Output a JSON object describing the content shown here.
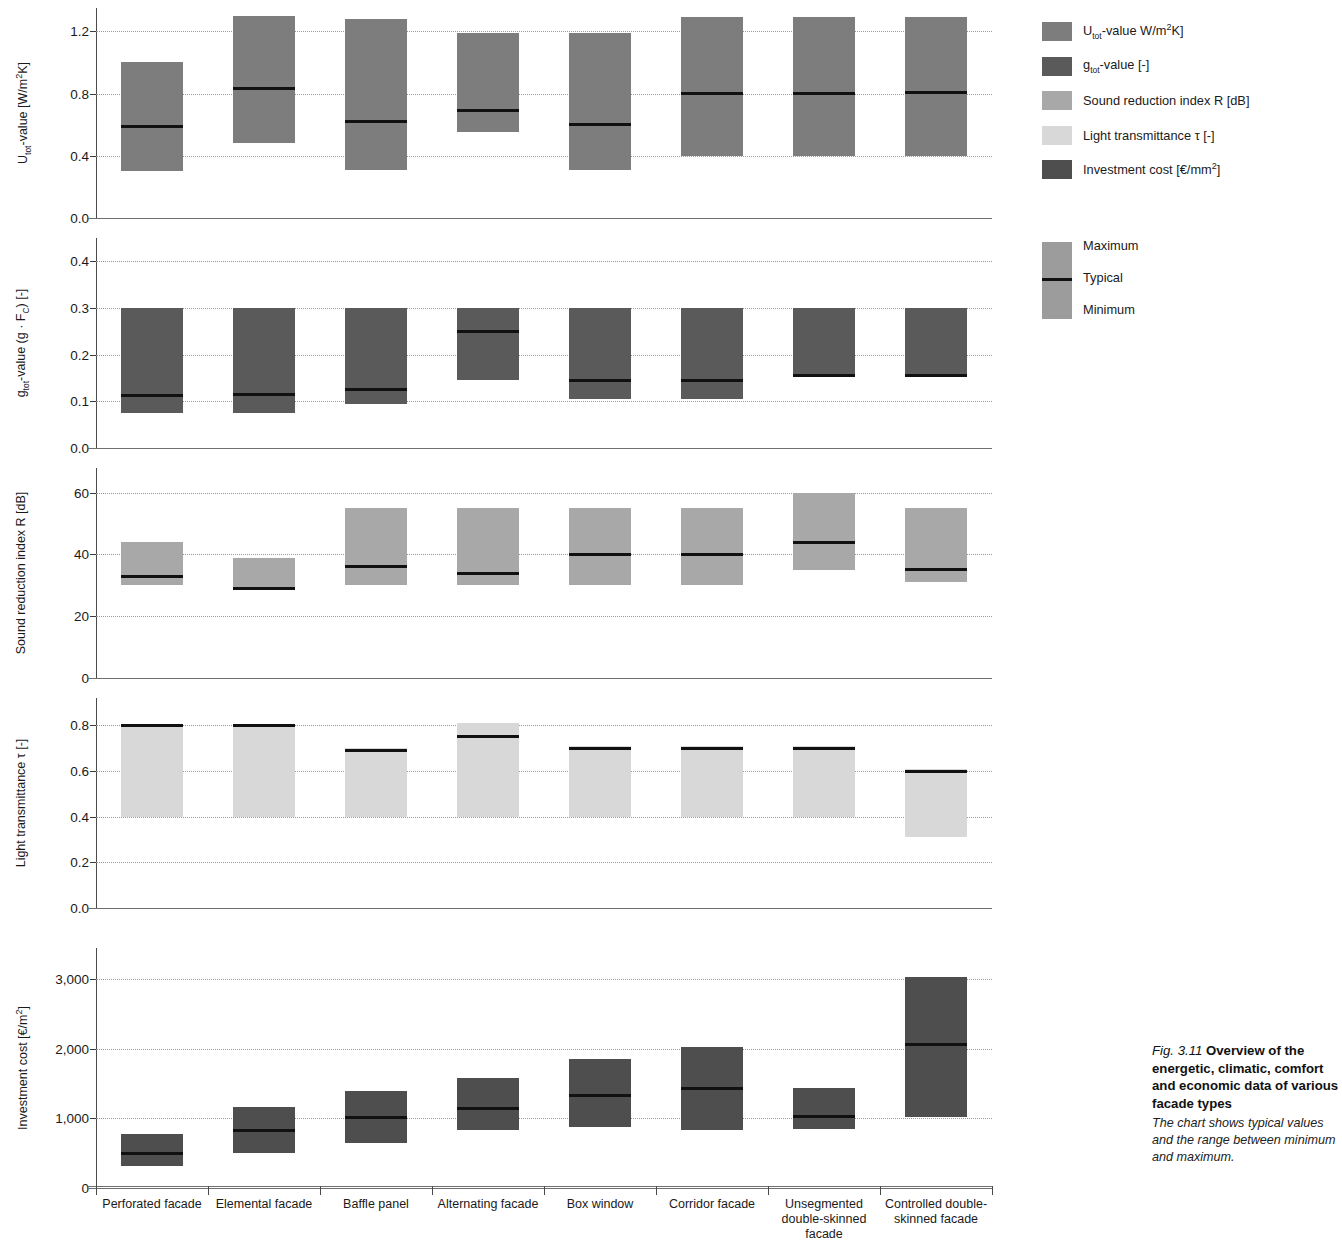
{
  "legend": {
    "items": [
      {
        "name": "u-tot-value",
        "label_html": "U<sub>tot</sub>-value W/m<sup>2</sup>K]",
        "label": "U tot-value W/m2K]",
        "color": "#7d7d7d"
      },
      {
        "name": "g-tot-value",
        "label_html": "g<sub>tot</sub>-value [-]",
        "label": "g tot-value [-]",
        "color": "#5a5a5a"
      },
      {
        "name": "sound-reduction-index",
        "label_html": "Sound reduction index R [dB]",
        "label": "Sound reduction index R [dB]",
        "color": "#a8a8a8"
      },
      {
        "name": "light-transmittance",
        "label_html": "Light transmittance τ [-]",
        "label": "Light transmittance τ [-]",
        "color": "#d8d8d8"
      },
      {
        "name": "investment-cost",
        "label_html": "Investment cost  [€/mm<sup>2</sup>]",
        "label": "Investment cost [€/mm2]",
        "color": "#4e4e4e"
      }
    ],
    "range_legend": {
      "maximum": "Maximum",
      "typical": "Typical",
      "minimum": "Minimum",
      "color": "#9c9c9c"
    }
  },
  "caption": {
    "fig_number": "Fig. 3.11",
    "title": "Overview of the energetic, climatic, comfort and economic data of various facade types",
    "body": "The chart shows typical values and the range between minimum and maximum."
  },
  "chart_data": {
    "type": "bar",
    "title": "Overview of the energetic, climatic, comfort and economic data of various facade types",
    "xlabel": "",
    "grid": true,
    "legend_position": "right",
    "categories": [
      "Perforated facade",
      "Elemental facade",
      "Baffle panel",
      "Alternating facade",
      "Box window",
      "Corridor facade",
      "Unsegmented double-skinned facade",
      "Controlled double-skinned facade"
    ],
    "panels": [
      {
        "key": "u_tot",
        "ylabel_html": "U<sub>tot</sub>-value [W/m<sup>2</sup>K]",
        "ylabel": "U tot-value [W/m2K]",
        "color": "#7d7d7d",
        "ylim": [
          0.0,
          1.35
        ],
        "yticks": [
          0.0,
          0.4,
          0.8,
          1.2
        ],
        "yticklabels": [
          "0.0",
          "0.4",
          "0.8",
          "1.2"
        ],
        "minimum": [
          0.3,
          0.48,
          0.31,
          0.55,
          0.31,
          0.4,
          0.4,
          0.4
        ],
        "typical": [
          0.59,
          0.83,
          0.62,
          0.69,
          0.6,
          0.8,
          0.8,
          0.81
        ],
        "maximum": [
          1.0,
          1.3,
          1.28,
          1.19,
          1.19,
          1.29,
          1.29,
          1.29
        ]
      },
      {
        "key": "g_tot",
        "ylabel_html": "g<sub>tot</sub>-value (g &middot; F<sub>C</sub>) [-]",
        "ylabel": "g tot-value (g . F C) [-]",
        "color": "#5a5a5a",
        "ylim": [
          0.0,
          0.45
        ],
        "yticks": [
          0.0,
          0.1,
          0.2,
          0.3,
          0.4
        ],
        "yticklabels": [
          "0.0",
          "0.1",
          "0.2",
          "0.3",
          "0.4"
        ],
        "minimum": [
          0.075,
          0.075,
          0.095,
          0.145,
          0.105,
          0.105,
          0.155,
          0.155
        ],
        "typical": [
          0.113,
          0.115,
          0.125,
          0.25,
          0.145,
          0.145,
          0.155,
          0.155
        ],
        "maximum": [
          0.3,
          0.3,
          0.3,
          0.3,
          0.3,
          0.3,
          0.3,
          0.3
        ]
      },
      {
        "key": "sound_reduction",
        "ylabel_html": "Sound reduction index R [dB]",
        "ylabel": "Sound reduction index R [dB]",
        "color": "#a8a8a8",
        "ylim": [
          0,
          68
        ],
        "yticks": [
          0,
          20,
          40,
          60
        ],
        "yticklabels": [
          "0",
          "20",
          "40",
          "60"
        ],
        "minimum": [
          30,
          29,
          30,
          30,
          30,
          30,
          35,
          31
        ],
        "typical": [
          33,
          29,
          36,
          34,
          40,
          40,
          44,
          35
        ],
        "maximum": [
          44,
          39,
          55,
          55,
          55,
          55,
          60,
          55
        ]
      },
      {
        "key": "light_transmittance",
        "ylabel_html": "Light transmittance τ [-]",
        "ylabel": "Light transmittance τ [-]",
        "color": "#d8d8d8",
        "ylim": [
          0.0,
          0.92
        ],
        "yticks": [
          0.0,
          0.2,
          0.4,
          0.6,
          0.8
        ],
        "yticklabels": [
          "0.0",
          "0.2",
          "0.4",
          "0.6",
          "0.8"
        ],
        "minimum": [
          0.4,
          0.4,
          0.4,
          0.4,
          0.4,
          0.4,
          0.4,
          0.31
        ],
        "typical": [
          0.8,
          0.8,
          0.69,
          0.75,
          0.7,
          0.7,
          0.7,
          0.6
        ],
        "maximum": [
          0.8,
          0.8,
          0.7,
          0.81,
          0.71,
          0.71,
          0.71,
          0.61
        ]
      },
      {
        "key": "investment_cost",
        "ylabel_html": "Investment cost [€/m<sup>2</sup>]",
        "ylabel": "Investment cost [€/m2]",
        "color": "#4e4e4e",
        "ylim": [
          0,
          3450
        ],
        "yticks": [
          0,
          1000,
          2000,
          3000
        ],
        "yticklabels": [
          "0",
          "1,000",
          "2,000",
          "3,000"
        ],
        "minimum": [
          320,
          510,
          640,
          830,
          870,
          840,
          850,
          1020
        ],
        "typical": [
          500,
          820,
          1010,
          1150,
          1330,
          1430,
          1030,
          2070
        ],
        "maximum": [
          780,
          1170,
          1400,
          1580,
          1860,
          2030,
          1440,
          3030
        ]
      }
    ]
  }
}
